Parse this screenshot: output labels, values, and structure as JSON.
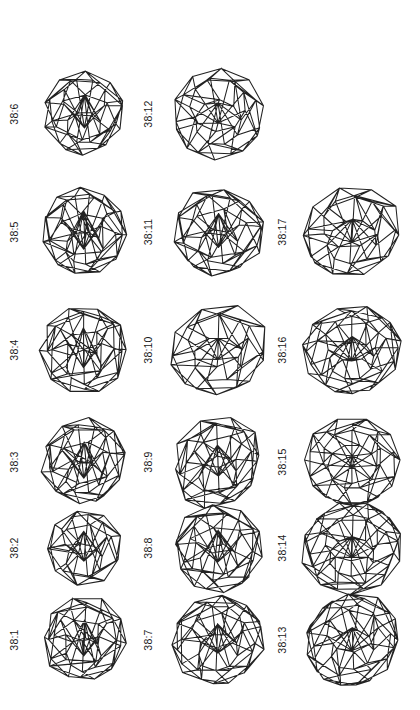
{
  "plate": {
    "kind": "polyhedra-isomer-plate",
    "description": "Wireframe drawings of 38-vertex fullerene-like polyhedra arranged in a 3-column grid, each labelled with a rotated caption.",
    "background_color": "#ffffff",
    "line_color": "#222222",
    "label_color": "#1a1a1a",
    "columns": 3,
    "rows": 6,
    "label_orientation": "rotated-90-ccw"
  },
  "cells": [
    {
      "label": "38:6",
      "column": 1,
      "row": 1,
      "empty": false,
      "shape": "truncated-icosahedral-a"
    },
    {
      "label": "38:12",
      "column": 2,
      "row": 1,
      "empty": false,
      "shape": "barrel-wide-a"
    },
    {
      "label": "",
      "column": 3,
      "row": 1,
      "empty": true,
      "shape": ""
    },
    {
      "label": "38:5",
      "column": 1,
      "row": 2,
      "empty": false,
      "shape": "round-cage-b"
    },
    {
      "label": "38:11",
      "column": 2,
      "row": 2,
      "empty": false,
      "shape": "oblate-cage-b"
    },
    {
      "label": "38:17",
      "column": 3,
      "row": 2,
      "empty": false,
      "shape": "oblate-wide-c"
    },
    {
      "label": "38:4",
      "column": 1,
      "row": 3,
      "empty": false,
      "shape": "round-cage-c"
    },
    {
      "label": "38:10",
      "column": 2,
      "row": 3,
      "empty": false,
      "shape": "oblate-cage-c"
    },
    {
      "label": "38:16",
      "column": 3,
      "row": 3,
      "empty": false,
      "shape": "oblate-wide-d"
    },
    {
      "label": "38:3",
      "column": 1,
      "row": 4,
      "empty": false,
      "shape": "round-cage-d"
    },
    {
      "label": "38:9",
      "column": 2,
      "row": 4,
      "empty": false,
      "shape": "tapered-cage-a"
    },
    {
      "label": "38:15",
      "column": 3,
      "row": 4,
      "empty": false,
      "shape": "symmetric-barrel-a"
    },
    {
      "label": "38:2",
      "column": 1,
      "row": 5,
      "empty": false,
      "shape": "small-round-cage"
    },
    {
      "label": "38:8",
      "column": 2,
      "row": 5,
      "empty": false,
      "shape": "oblate-cage-e"
    },
    {
      "label": "38:14",
      "column": 3,
      "row": 5,
      "empty": false,
      "shape": "oblate-wide-e"
    },
    {
      "label": "38:1",
      "column": 1,
      "row": 6,
      "empty": false,
      "shape": "round-cage-f"
    },
    {
      "label": "38:7",
      "column": 2,
      "row": 6,
      "empty": false,
      "shape": "oblate-cage-f"
    },
    {
      "label": "38:13",
      "column": 3,
      "row": 6,
      "empty": false,
      "shape": "oblate-wide-f"
    }
  ]
}
